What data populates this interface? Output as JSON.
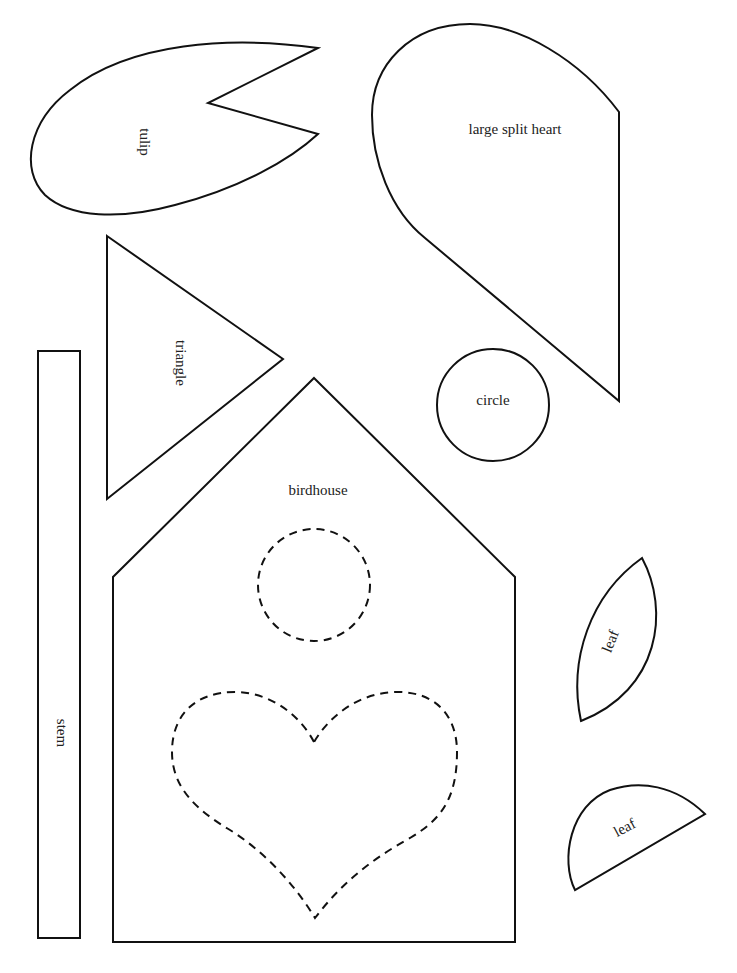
{
  "page": {
    "background": "#ffffff",
    "stroke_color": "#111111",
    "text_color": "#222222"
  },
  "shapes": {
    "tulip": {
      "label": "tulip"
    },
    "large_split_heart": {
      "label": "large split heart"
    },
    "triangle": {
      "label": "triangle"
    },
    "stem": {
      "label": "stem"
    },
    "circle": {
      "label": "circle"
    },
    "birdhouse": {
      "label": "birdhouse"
    },
    "leaf_upper": {
      "label": "leaf"
    },
    "leaf_lower": {
      "label": "leaf"
    }
  }
}
